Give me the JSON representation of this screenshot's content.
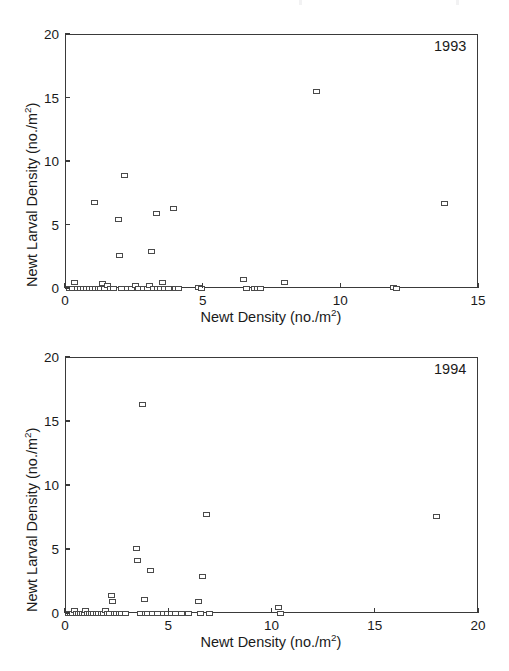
{
  "figure": {
    "background_color": "#ffffff",
    "axis_color": "#3a3a3a",
    "marker_color": "#4a4a4a",
    "text_color": "#1a1a1a"
  },
  "panels": [
    {
      "key": "p1993",
      "year_label": "1993",
      "xlabel_main": "Newt Density (no./m",
      "xlabel_exp": "2",
      "xlabel_tail": ")",
      "ylabel_main": "Newt Larval Density (no./m",
      "ylabel_exp": "2",
      "ylabel_tail": ")",
      "xticks": [
        "0",
        "5",
        "10",
        "15"
      ],
      "yticks": [
        "0",
        "5",
        "10",
        "15",
        "20"
      ]
    },
    {
      "key": "p1994",
      "year_label": "1994",
      "xlabel_main": "Newt Density (no./m",
      "xlabel_exp": "2",
      "xlabel_tail": ")",
      "ylabel_main": "Newt Larval Density (no./m",
      "ylabel_exp": "2",
      "ylabel_tail": ")",
      "xticks": [
        "0",
        "5",
        "10",
        "15",
        "20"
      ],
      "yticks": [
        "0",
        "5",
        "10",
        "15",
        "20"
      ]
    }
  ],
  "chart_data": [
    {
      "type": "scatter",
      "title": "1993",
      "xlabel": "Newt Density (no./m2)",
      "ylabel": "Newt Larval Density (no./m2)",
      "xlim": [
        0,
        15
      ],
      "ylim": [
        0,
        20
      ],
      "xticks": [
        0,
        5,
        10,
        15
      ],
      "yticks": [
        0,
        5,
        10,
        15,
        20
      ],
      "grid": false,
      "legend": false,
      "marker": "open-square",
      "points": [
        [
          0.12,
          0.05
        ],
        [
          0.22,
          0.05
        ],
        [
          0.3,
          0.55
        ],
        [
          0.4,
          0.05
        ],
        [
          0.52,
          0.05
        ],
        [
          0.62,
          0.05
        ],
        [
          0.74,
          0.05
        ],
        [
          0.86,
          0.05
        ],
        [
          0.95,
          0.05
        ],
        [
          1.02,
          6.85
        ],
        [
          1.08,
          0.05
        ],
        [
          1.18,
          0.05
        ],
        [
          1.26,
          0.05
        ],
        [
          1.33,
          0.4
        ],
        [
          1.4,
          0.05
        ],
        [
          1.5,
          0.25
        ],
        [
          1.62,
          0.05
        ],
        [
          1.72,
          0.05
        ],
        [
          1.9,
          5.45
        ],
        [
          1.94,
          2.65
        ],
        [
          2.02,
          0.05
        ],
        [
          2.12,
          8.95
        ],
        [
          2.22,
          0.05
        ],
        [
          2.38,
          0.05
        ],
        [
          2.52,
          0.25
        ],
        [
          2.62,
          0.05
        ],
        [
          2.8,
          0.05
        ],
        [
          2.95,
          0.05
        ],
        [
          3.02,
          0.25
        ],
        [
          3.1,
          2.95
        ],
        [
          3.18,
          0.05
        ],
        [
          3.28,
          5.95
        ],
        [
          3.32,
          0.05
        ],
        [
          3.42,
          0.05
        ],
        [
          3.5,
          0.55
        ],
        [
          3.58,
          0.05
        ],
        [
          3.72,
          0.05
        ],
        [
          3.9,
          6.35
        ],
        [
          3.96,
          0.05
        ],
        [
          4.1,
          0.05
        ],
        [
          4.8,
          0.1
        ],
        [
          4.92,
          0.05
        ],
        [
          6.45,
          0.75
        ],
        [
          6.55,
          0.05
        ],
        [
          6.85,
          0.05
        ],
        [
          6.95,
          0.05
        ],
        [
          7.05,
          0.05
        ],
        [
          7.95,
          0.55
        ],
        [
          9.1,
          15.55
        ],
        [
          11.9,
          0.08
        ],
        [
          12.0,
          0.05
        ],
        [
          13.75,
          6.7
        ]
      ]
    },
    {
      "type": "scatter",
      "title": "1994",
      "xlabel": "Newt Density (no./m2)",
      "ylabel": "Newt Larval Density (no./m2)",
      "xlim": [
        0,
        20
      ],
      "ylim": [
        0,
        20
      ],
      "xticks": [
        0,
        5,
        10,
        15,
        20
      ],
      "yticks": [
        0,
        5,
        10,
        15,
        20
      ],
      "grid": false,
      "legend": false,
      "marker": "open-square",
      "points": [
        [
          0.1,
          0.05
        ],
        [
          0.2,
          0.05
        ],
        [
          0.32,
          0.05
        ],
        [
          0.42,
          0.25
        ],
        [
          0.52,
          0.05
        ],
        [
          0.62,
          0.05
        ],
        [
          0.7,
          0.05
        ],
        [
          0.78,
          0.05
        ],
        [
          0.88,
          0.05
        ],
        [
          0.96,
          0.25
        ],
        [
          1.04,
          0.05
        ],
        [
          1.12,
          0.05
        ],
        [
          1.22,
          0.05
        ],
        [
          1.34,
          0.05
        ],
        [
          1.46,
          0.05
        ],
        [
          1.58,
          0.05
        ],
        [
          1.7,
          0.05
        ],
        [
          1.82,
          0.05
        ],
        [
          1.92,
          0.25
        ],
        [
          2.02,
          0.05
        ],
        [
          2.12,
          0.05
        ],
        [
          2.22,
          1.45
        ],
        [
          2.26,
          0.95
        ],
        [
          2.34,
          0.05
        ],
        [
          2.46,
          0.05
        ],
        [
          2.58,
          0.05
        ],
        [
          2.7,
          0.05
        ],
        [
          2.88,
          0.05
        ],
        [
          3.4,
          5.1
        ],
        [
          3.48,
          4.15
        ],
        [
          3.6,
          0.05
        ],
        [
          3.72,
          16.4
        ],
        [
          3.8,
          1.15
        ],
        [
          3.86,
          0.05
        ],
        [
          3.94,
          0.05
        ],
        [
          4.1,
          3.4
        ],
        [
          4.2,
          0.05
        ],
        [
          4.45,
          0.05
        ],
        [
          4.7,
          0.05
        ],
        [
          4.9,
          0.05
        ],
        [
          5.1,
          0.05
        ],
        [
          5.3,
          0.05
        ],
        [
          5.6,
          0.05
        ],
        [
          5.95,
          0.05
        ],
        [
          6.4,
          0.95
        ],
        [
          6.5,
          0.05
        ],
        [
          6.6,
          2.95
        ],
        [
          6.78,
          7.75
        ],
        [
          6.95,
          0.05
        ],
        [
          10.3,
          0.5
        ],
        [
          10.4,
          0.05
        ],
        [
          17.95,
          7.6
        ]
      ]
    }
  ]
}
